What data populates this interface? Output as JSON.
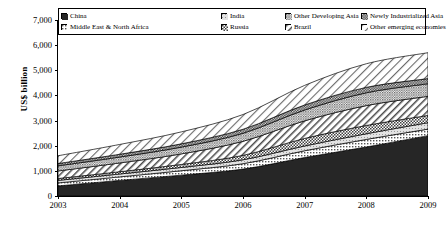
{
  "chart_data": {
    "type": "area",
    "title": "",
    "xlabel": "",
    "ylabel": "US$ billion",
    "ylim": [
      0,
      7000
    ],
    "yticks": [
      "0",
      "1,000",
      "2,000",
      "3,000",
      "4,000",
      "5,000",
      "6,000",
      "7,000"
    ],
    "ytick_values": [
      0,
      1000,
      2000,
      3000,
      4000,
      5000,
      6000,
      7000
    ],
    "x": [
      2003,
      2004,
      2005,
      2006,
      2007,
      2008,
      2009
    ],
    "xtick_labels": [
      "2003",
      "2004",
      "2005",
      "2006",
      "2007",
      "2008",
      "2009"
    ],
    "grid": false,
    "legend_position": "top-inside",
    "stacked": true,
    "series": [
      {
        "name": "China",
        "pattern": "solid-black",
        "color": "#262626",
        "values": [
          400,
          620,
          830,
          1070,
          1530,
          1950,
          2400
        ]
      },
      {
        "name": "Middle East & North Africa",
        "pattern": "fine-dots",
        "color": "#b5b5b5",
        "values": [
          120,
          140,
          175,
          215,
          270,
          300,
          260
        ]
      },
      {
        "name": "India",
        "pattern": "light-grey",
        "color": "#d9d9d9",
        "values": [
          100,
          115,
          130,
          155,
          190,
          225,
          255
        ]
      },
      {
        "name": "Russia",
        "pattern": "fine-check",
        "color": "#8c8c8c",
        "values": [
          75,
          90,
          120,
          175,
          300,
          330,
          290
        ]
      },
      {
        "name": "Brazil",
        "pattern": "diag-hatch",
        "color": "#efefef",
        "values": [
          300,
          350,
          420,
          560,
          700,
          790,
          760
        ]
      },
      {
        "name": "Other Developing Asia",
        "pattern": "dense-dots",
        "color": "#a8a8a8",
        "values": [
          205,
          235,
          270,
          320,
          430,
          510,
          500
        ]
      },
      {
        "name": "Newly Industrialized Asia",
        "pattern": "checkerboard",
        "color": "#5f5f5f",
        "values": [
          90,
          110,
          130,
          160,
          200,
          215,
          205
        ]
      },
      {
        "name": "Other emerging economies",
        "pattern": "sparse-hatch",
        "color": "#f2f2f2",
        "values": [
          310,
          390,
          475,
          585,
          780,
          940,
          1030
        ]
      }
    ],
    "totals": [
      1600,
      2050,
      2550,
      3240,
      4400,
      5260,
      5700
    ]
  },
  "legend": {
    "row1": [
      {
        "label": "China",
        "pattern": "solid-black"
      },
      {
        "label": "India",
        "pattern": "light-grey"
      },
      {
        "label": "Other Developing Asia",
        "pattern": "dense-dots"
      },
      {
        "label": "Newly Industrialized Asia",
        "pattern": "checkerboard"
      }
    ],
    "row2": [
      {
        "label": "Middle East & North Africa",
        "pattern": "fine-dots"
      },
      {
        "label": "Russia",
        "pattern": "fine-check"
      },
      {
        "label": "Brazil",
        "pattern": "diag-hatch"
      },
      {
        "label": "Other emerging economies",
        "pattern": "sparse-hatch"
      }
    ]
  }
}
